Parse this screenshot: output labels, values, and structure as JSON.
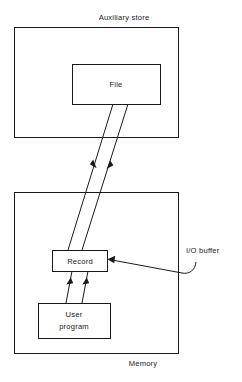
{
  "diagram": {
    "title": "Auxiliary store",
    "containers": [
      {
        "id": "auxiliary-store",
        "label": "Auxiliary store",
        "label_position": "above",
        "x": 14,
        "y": 27,
        "width": 164,
        "height": 110
      },
      {
        "id": "memory",
        "label": "Memory",
        "label_position": "below",
        "x": 14,
        "y": 192,
        "width": 164,
        "height": 161
      }
    ],
    "boxes": [
      {
        "id": "file",
        "label": "File",
        "lines": [
          "File"
        ],
        "x": 72,
        "y": 64,
        "width": 88,
        "height": 40,
        "parent": "auxiliary-store"
      },
      {
        "id": "record",
        "label": "Record",
        "lines": [
          "Record"
        ],
        "x": 52,
        "y": 250,
        "width": 55,
        "height": 21,
        "parent": "memory"
      },
      {
        "id": "user-program",
        "label": "User program",
        "lines": [
          "User",
          "program"
        ],
        "x": 38,
        "y": 303,
        "width": 72,
        "height": 35,
        "parent": "memory"
      }
    ],
    "connectors": [
      {
        "id": "file-to-record",
        "from": "file",
        "to": "record",
        "direction": "down",
        "x1": 113,
        "y1": 104,
        "x2": 68,
        "y2": 250,
        "arrow_at": {
          "x": 94,
          "y": 165,
          "angle": "down-left"
        }
      },
      {
        "id": "record-to-file",
        "from": "record",
        "to": "file",
        "direction": "up",
        "x1": 82,
        "y1": 250,
        "x2": 128,
        "y2": 104,
        "arrow_at": {
          "x": 108,
          "y": 166,
          "angle": "up-right"
        }
      },
      {
        "id": "user-program-to-record-left",
        "from": "user-program",
        "to": "record",
        "direction": "up",
        "x1": 66,
        "y1": 303,
        "x2": 72,
        "y2": 271,
        "arrow_at": {
          "x": 70,
          "y": 284,
          "angle": "up-right"
        }
      },
      {
        "id": "user-program-to-record-right",
        "from": "user-program",
        "to": "record",
        "direction": "up",
        "x1": 82,
        "y1": 303,
        "x2": 88,
        "y2": 271,
        "arrow_at": {
          "x": 86,
          "y": 284,
          "angle": "up-right"
        }
      }
    ],
    "callouts": [
      {
        "id": "io-buffer",
        "label": "I/O buffer",
        "label_x": 187,
        "label_y": 253,
        "points_to": "record",
        "arrow_at": {
          "x": 108,
          "y": 260,
          "angle": "left"
        }
      }
    ]
  },
  "colors": {
    "stroke": "#1a1a1a",
    "text": "#1a1a1a",
    "background": "#ffffff"
  }
}
